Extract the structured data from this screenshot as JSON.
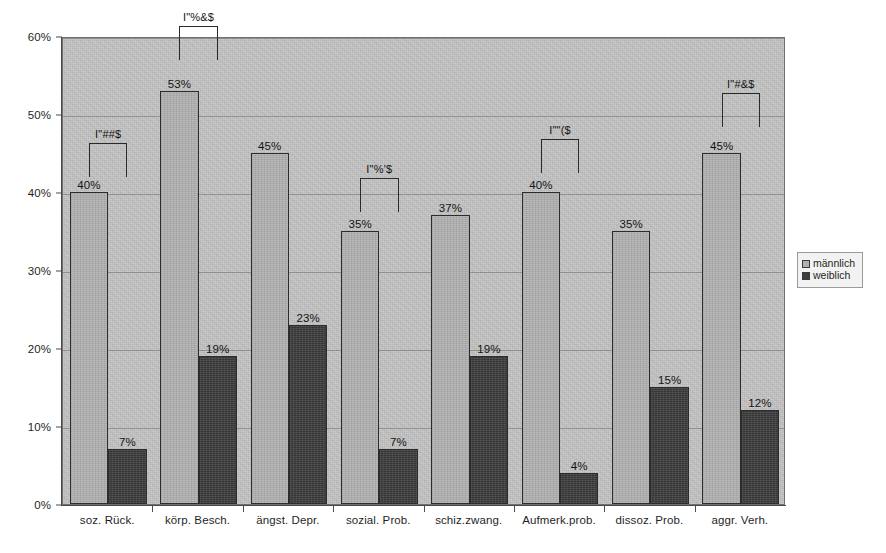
{
  "chart_data": {
    "type": "bar",
    "title": "",
    "xlabel": "",
    "ylabel": "",
    "ylim": [
      0,
      60
    ],
    "y_tick_labels": [
      "0%",
      "10%",
      "20%",
      "30%",
      "40%",
      "50%",
      "60%"
    ],
    "y_tick_values": [
      0,
      10,
      20,
      30,
      40,
      50,
      60
    ],
    "grid": true,
    "legend_position": "right",
    "categories": [
      "soz. Rück.",
      "körp. Besch.",
      "ängst. Depr.",
      "sozial. Prob.",
      "schiz.zwang.",
      "Aufmerk.prob.",
      "dissoz. Prob.",
      "aggr. Verh."
    ],
    "series": [
      {
        "name": "männlich",
        "color": "#b0b0b0",
        "values": [
          40,
          53,
          45,
          35,
          37,
          40,
          35,
          45
        ],
        "data_labels": [
          "40%",
          "53%",
          "45%",
          "35%",
          "37%",
          "40%",
          "35%",
          "45%"
        ]
      },
      {
        "name": "weiblich",
        "color": "#3d3d3d",
        "values": [
          7,
          19,
          23,
          7,
          19,
          4,
          15,
          12
        ],
        "data_labels": [
          "7%",
          "19%",
          "23%",
          "7%",
          "19%",
          "4%",
          "15%",
          "12%"
        ]
      }
    ],
    "annotations": [
      {
        "category_index": 0,
        "label": "I\"##$",
        "top_percent": 46.5
      },
      {
        "category_index": 1,
        "label": "I\"%&$",
        "top_percent": 61.5
      },
      {
        "category_index": 3,
        "label": "I\"%'$",
        "top_percent": 42.0
      },
      {
        "category_index": 5,
        "label": "I\"\"($",
        "top_percent": 47.0
      },
      {
        "category_index": 7,
        "label": "I\"#&$",
        "top_percent": 53.0
      }
    ]
  },
  "legend": {
    "items": [
      {
        "label": "männlich",
        "swatch": "male"
      },
      {
        "label": "weiblich",
        "swatch": "female"
      }
    ]
  }
}
